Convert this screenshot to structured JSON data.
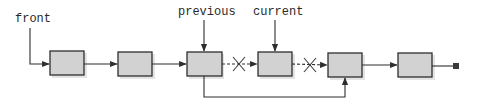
{
  "diagram": {
    "type": "linked-list-node-removal",
    "labels": {
      "front": "front",
      "previous": "previous",
      "current": "current"
    },
    "nodes": [
      {
        "id": "node-1",
        "x": 50,
        "y": 51
      },
      {
        "id": "node-2",
        "x": 118,
        "y": 52
      },
      {
        "id": "node-3-previous",
        "x": 187,
        "y": 52
      },
      {
        "id": "node-4-current",
        "x": 258,
        "y": 52
      },
      {
        "id": "node-5",
        "x": 328,
        "y": 53
      },
      {
        "id": "node-6",
        "x": 398,
        "y": 53
      }
    ],
    "links": [
      {
        "from": "node-1",
        "to": "node-2",
        "style": "solid"
      },
      {
        "from": "node-2",
        "to": "node-3-previous",
        "style": "solid"
      },
      {
        "from": "node-3-previous",
        "to": "node-4-current",
        "style": "dashed",
        "crossed_out": true
      },
      {
        "from": "node-4-current",
        "to": "node-5",
        "style": "dashed",
        "crossed_out": true
      },
      {
        "from": "node-3-previous",
        "to": "node-5",
        "style": "solid",
        "route": "bypass-below"
      },
      {
        "from": "node-5",
        "to": "node-6",
        "style": "solid"
      },
      {
        "from": "node-6",
        "to": "null-terminator",
        "style": "solid"
      }
    ],
    "colors": {
      "node_fill": "#d2d2d2",
      "stroke": "#2e2e2e",
      "background": "#ffffff"
    }
  }
}
